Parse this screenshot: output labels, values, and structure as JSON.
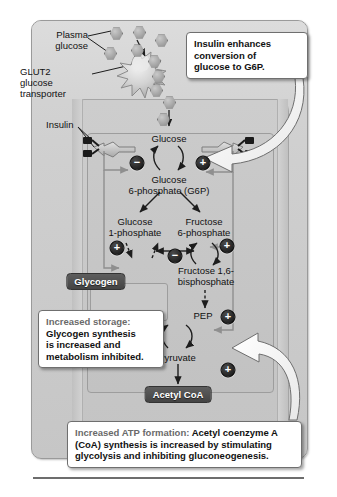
{
  "figure": {
    "colors": {
      "panel_bg": "#cfcfcf",
      "cell_bg": "#c6c6c6",
      "callout_bg": "#ffffff",
      "callout_border": "#6f6f6f",
      "pill_bg": "#4d4d4d",
      "badge_bg": "#111111",
      "arrow_white": "#ffffff"
    }
  },
  "outside_labels": {
    "plasma_glucose": "Plasma\nglucose",
    "plasma_glucose_line1": "Plasma",
    "plasma_glucose_line2": "glucose",
    "glut2_line1": "GLUT2",
    "glut2_line2": "glucose",
    "glut2_line3": "transporter",
    "insulin": "Insulin"
  },
  "pathway": {
    "nodes": [
      {
        "id": "glucose",
        "label": "Glucose",
        "kind": "text"
      },
      {
        "id": "g6p",
        "label_line1": "Glucose",
        "label_line2": "6-phosphate (G6P)",
        "kind": "text"
      },
      {
        "id": "g1p",
        "label_line1": "Glucose",
        "label_line2": "1-phosphate",
        "kind": "text"
      },
      {
        "id": "f6p",
        "label_line1": "Fructose",
        "label_line2": "6-phosphate",
        "kind": "text"
      },
      {
        "id": "fbp",
        "label_line1": "Fructose 1,6-",
        "label_line2": "bisphosphate",
        "kind": "text"
      },
      {
        "id": "pep",
        "label": "PEP",
        "kind": "text"
      },
      {
        "id": "pyruvate",
        "label": "Pyruvate",
        "kind": "text"
      },
      {
        "id": "glycogen",
        "label": "Glycogen",
        "kind": "pill"
      },
      {
        "id": "acetyl_coa",
        "label": "Acetyl CoA",
        "kind": "pill"
      }
    ],
    "regulators": [
      {
        "id": "reg-g6p-inhibit",
        "sign": "−",
        "meaning": "inhibited"
      },
      {
        "id": "reg-g6p-stimulate",
        "sign": "+",
        "meaning": "stimulated"
      },
      {
        "id": "reg-g1p-stimulate",
        "sign": "+",
        "meaning": "stimulated"
      },
      {
        "id": "reg-glycogen-inhibit",
        "sign": "−",
        "meaning": "inhibited"
      },
      {
        "id": "reg-f6p-stimulate",
        "sign": "+",
        "meaning": "stimulated"
      },
      {
        "id": "reg-pep-stimulate",
        "sign": "+",
        "meaning": "stimulated"
      },
      {
        "id": "reg-pyruvate-inhibit",
        "sign": "−",
        "meaning": "inhibited"
      },
      {
        "id": "reg-acetyl-stimulate",
        "sign": "+",
        "meaning": "stimulated"
      }
    ]
  },
  "callouts": {
    "insulin_g6p": {
      "line1": "Insulin enhances",
      "line2": "conversion of",
      "line3": "glucose to G6P."
    },
    "storage": {
      "lead": "Increased storage:",
      "line1": "Glycogen synthesis",
      "line2": "is increased and",
      "line3": "metabolism inhibited."
    },
    "atp": {
      "lead": "Increased ATP formation:",
      "rest1": " Acetyl coenzyme A",
      "line2": "(CoA) synthesis is increased by stimulating",
      "line3": "glycolysis and inhibiting gluconeogenesis."
    }
  },
  "icons": {
    "glucose_hexagon": "hexagon-glucose-icon",
    "glut2": "glut2-transporter-icon",
    "insulin_receptor": "insulin-receptor-icon",
    "white_arrow": "curved-white-arrow-icon"
  }
}
